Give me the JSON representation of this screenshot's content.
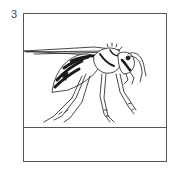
{
  "item": {
    "number": "3",
    "illustration": "wasp-icon",
    "answer_value": ""
  },
  "colors": {
    "border": "#555555",
    "ink": "#1a1a1a",
    "number": "#444444"
  }
}
